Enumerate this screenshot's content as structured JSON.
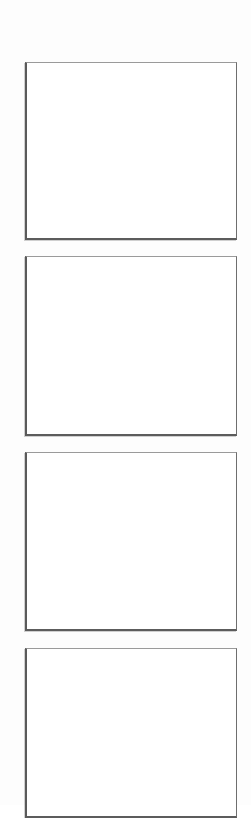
{
  "page": {
    "type": "blank storyboard / comic panel template",
    "background_color": "#ffffff",
    "border_color": "#5c5c5c"
  },
  "panels": [
    {
      "index": 1,
      "content": "",
      "left": 25,
      "top": 62,
      "width": 212,
      "height": 178
    },
    {
      "index": 2,
      "content": "",
      "left": 25,
      "top": 256,
      "width": 212,
      "height": 180
    },
    {
      "index": 3,
      "content": "",
      "left": 25,
      "top": 452,
      "width": 212,
      "height": 179
    },
    {
      "index": 4,
      "content": "",
      "left": 25,
      "top": 648,
      "width": 212,
      "height": 170
    }
  ]
}
